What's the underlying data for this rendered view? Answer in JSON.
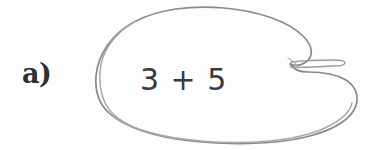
{
  "figure": {
    "background_color": "#fdfdfd",
    "item_label": "a)",
    "expression": "3 + 5",
    "expression_parts": {
      "left_operand": "3",
      "operator": "+",
      "right_operand": "5"
    },
    "shape": {
      "name": "hand-drawn-blob",
      "description": "closed hand-drawn kidney/blob outline with a narrow tapered notch on the right side",
      "stroke_color": "#8a8a8a",
      "stroke_color_secondary": "#a8a8a8",
      "fill_color": "none",
      "stroke_width": 1.6,
      "double_stroke": true
    },
    "text_color": "#3a3a3a",
    "label_color": "#2f2f2f"
  }
}
